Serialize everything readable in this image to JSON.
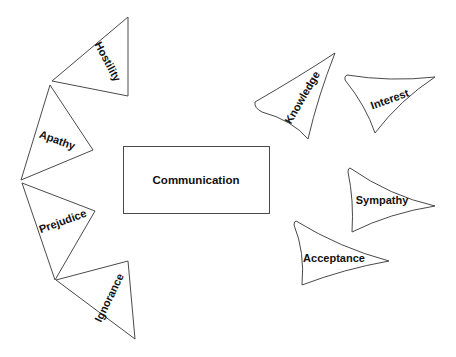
{
  "diagram": {
    "center": {
      "label": "Communication"
    },
    "barriers": [
      {
        "label": "Hostility"
      },
      {
        "label": "Apathy"
      },
      {
        "label": "Prejudice"
      },
      {
        "label": "Ignorance"
      }
    ],
    "enablers": [
      {
        "label": "Knowledge"
      },
      {
        "label": "Interest"
      },
      {
        "label": "Sympathy"
      },
      {
        "label": "Acceptance"
      }
    ],
    "colors": {
      "stroke": "#4a4a4a",
      "text": "#111111",
      "background": "#ffffff"
    }
  }
}
